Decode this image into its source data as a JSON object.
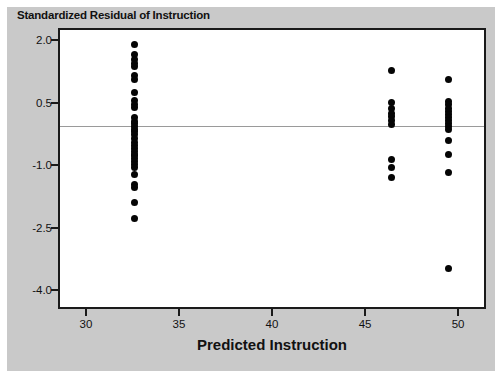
{
  "figure": {
    "title": "Standardized Residual of Instruction",
    "xaxis_title": "Predicted Instruction",
    "background_color": "#c9c9c9",
    "plot_background_color": "#ffffff",
    "frame_color": "#1a1a1a",
    "marker_color": "#050505",
    "reference_line_color": "#9a9a9a"
  },
  "chart_data": {
    "type": "scatter",
    "title": "Standardized Residual of Instruction",
    "xlabel": "Predicted Instruction",
    "ylabel": "Standardized Residual of Instruction",
    "xlim": [
      28.5,
      51.5
    ],
    "ylim": [
      -4.45,
      2.3
    ],
    "xticks": [
      30,
      35,
      40,
      45,
      50
    ],
    "xtick_labels": [
      "30",
      "35",
      "40",
      "45",
      "50"
    ],
    "yticks": [
      2.0,
      0.5,
      -1.0,
      -2.5,
      -4.0
    ],
    "ytick_labels": [
      "2.0",
      "0.5",
      "-1.0",
      "-2.5",
      "-4.0"
    ],
    "grid": false,
    "legend": null,
    "reference_lines": [
      {
        "axis": "y",
        "value": 0.0
      }
    ],
    "series": [
      {
        "name": "Standardized residuals",
        "x": [
          32.5,
          32.5,
          32.5,
          32.5,
          32.5,
          32.5,
          32.5,
          32.5,
          32.5,
          32.5,
          32.5,
          32.5,
          32.5,
          32.5,
          32.5,
          32.5,
          32.5,
          32.5,
          32.5,
          32.5,
          32.5,
          32.5,
          32.5,
          32.5,
          32.5,
          32.5,
          32.5,
          32.5,
          32.5,
          32.5,
          32.5,
          32.5,
          32.5,
          32.5,
          46.3,
          46.3,
          46.3,
          46.3,
          46.3,
          46.3,
          46.3,
          46.3,
          46.3,
          46.3,
          49.4,
          49.4,
          49.4,
          49.4,
          49.4,
          49.4,
          49.4,
          49.4,
          49.4,
          49.4,
          49.4,
          49.4,
          49.4,
          49.4,
          49.4
        ],
        "y": [
          1.95,
          1.7,
          1.58,
          1.5,
          1.42,
          1.2,
          1.12,
          0.8,
          0.6,
          0.52,
          0.45,
          0.2,
          0.1,
          0.05,
          -0.02,
          -0.08,
          -0.15,
          -0.22,
          -0.3,
          -0.4,
          -0.48,
          -0.55,
          -0.62,
          -0.68,
          -0.72,
          -0.78,
          -0.85,
          -0.92,
          -1.0,
          -1.18,
          -1.42,
          -1.48,
          -1.85,
          -2.22,
          1.32,
          0.55,
          0.42,
          0.3,
          0.22,
          0.12,
          0.02,
          -0.8,
          -1.0,
          -1.25,
          1.1,
          0.58,
          0.5,
          0.42,
          0.35,
          0.28,
          0.2,
          0.12,
          0.05,
          -0.02,
          -0.1,
          -0.35,
          -0.7,
          -1.12,
          -3.42
        ]
      }
    ]
  }
}
